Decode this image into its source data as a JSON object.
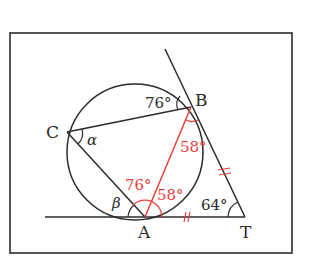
{
  "colors": {
    "ink": "#2b2b2b",
    "accent": "#e8413a",
    "background": "#ffffff"
  },
  "points": {
    "A": {
      "label": "A"
    },
    "B": {
      "label": "B"
    },
    "C": {
      "label": "C"
    },
    "T": {
      "label": "T"
    }
  },
  "angles": {
    "angle_B_black": "76°",
    "angle_B_red": "58°",
    "angle_A_left_red": "76°",
    "angle_A_right_red": "58°",
    "angle_T": "64°",
    "alpha": "α",
    "beta": "β"
  },
  "marks": {
    "equal_TB": "=",
    "equal_AT": "〃"
  }
}
